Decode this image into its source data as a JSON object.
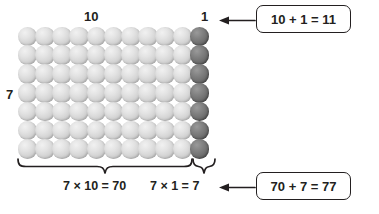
{
  "diagram": {
    "title_visible": false,
    "labels": {
      "columns": "10",
      "ones_column": "1",
      "rows": "7"
    },
    "equations": {
      "tens_product": "7 × 10 = 70",
      "ones_product": "7 × 1 = 7"
    },
    "callouts": {
      "top": "10 + 1 = 11",
      "bottom": "70 + 7 = 77"
    },
    "array": {
      "rows": 7,
      "light_columns": 10,
      "dark_columns": 1,
      "total_columns": 11,
      "light_count": 70,
      "dark_count": 7,
      "total_count": 77
    },
    "colors": {
      "light_dot": "#cfcfcf",
      "dark_dot": "#6a6a6a",
      "ink": "#231f20",
      "background": "#ffffff"
    },
    "icons": {
      "arrow_top": "arrow-left-icon",
      "arrow_bottom": "arrow-left-icon",
      "brace_tens": "curly-brace-icon",
      "brace_ones": "curly-brace-icon"
    }
  }
}
